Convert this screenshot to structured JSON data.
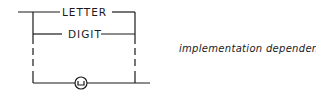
{
  "diagram": {
    "type": "syntax-diagram",
    "branches": [
      {
        "label": "LETTER"
      },
      {
        "label": "DIGIT"
      },
      {
        "label": "␣",
        "shape": "circle",
        "meaning": "space"
      }
    ],
    "annotation": "implementation dependent"
  }
}
